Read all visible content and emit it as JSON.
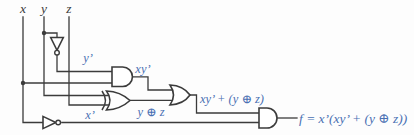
{
  "colors": {
    "wire": "#3b3b3b",
    "label": "#4a70b3",
    "background": "#fdfdfd"
  },
  "inputs": {
    "x": "x",
    "y": "y",
    "z": "z"
  },
  "labels": {
    "y_not": "y’",
    "xy_not": "xy’",
    "x_not": "x’",
    "y_xor_z": "y ⊕ z",
    "or_output": "xy’ + (y ⊕ z)",
    "final_output": "f = x’(xy’ + (y ⊕ z))"
  },
  "gates": {
    "inverter_y": "not-gate",
    "and1": "and-gate",
    "xor": "xor-gate",
    "or": "or-gate",
    "inverter_x": "not-gate",
    "and2": "and-gate"
  }
}
